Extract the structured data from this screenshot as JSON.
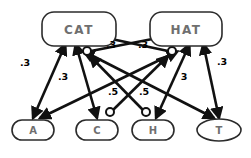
{
  "diagram": {
    "background_color": "#ffffff",
    "edge_color": "#111111",
    "node_border_color": "#2b2b2b",
    "node_fill_color": "#ffffff",
    "node_text_color": "#6f6f6f",
    "word_nodes": [
      {
        "id": "cat",
        "label": "CAT",
        "shape": "rounded-rect",
        "cx": 79,
        "cy": 29,
        "w": 74,
        "h": 34
      },
      {
        "id": "hat",
        "label": "HAT",
        "shape": "rounded-rect",
        "cx": 186,
        "cy": 29,
        "w": 72,
        "h": 34
      }
    ],
    "letter_nodes": [
      {
        "id": "a",
        "label": "A",
        "shape": "rounded-rect",
        "cx": 33,
        "cy": 130,
        "w": 42,
        "h": 20
      },
      {
        "id": "c",
        "label": "C",
        "shape": "rounded-rect",
        "cx": 97,
        "cy": 130,
        "w": 42,
        "h": 20
      },
      {
        "id": "h",
        "label": "H",
        "shape": "rounded-rect",
        "cx": 153,
        "cy": 130,
        "w": 42,
        "h": 20
      },
      {
        "id": "t",
        "label": "T",
        "shape": "ellipse",
        "cx": 219,
        "cy": 130,
        "w": 44,
        "h": 22
      }
    ],
    "edges": [
      {
        "id": "cat-a",
        "from": "cat",
        "to": "a",
        "type": "excitatory-bidirectional",
        "weight": ".3"
      },
      {
        "id": "cat-c",
        "from": "cat",
        "to": "c",
        "type": "excitatory-bidirectional",
        "weight": ".3"
      },
      {
        "id": "cat-t",
        "from": "cat",
        "to": "t",
        "type": "excitatory-bidirectional",
        "weight": ".5"
      },
      {
        "id": "hat-h",
        "from": "hat",
        "to": "h",
        "type": "excitatory-bidirectional",
        "weight": "3"
      },
      {
        "id": "hat-t",
        "from": "hat",
        "to": "t",
        "type": "excitatory-bidirectional",
        "weight": ".3"
      },
      {
        "id": "hat-a",
        "from": "hat",
        "to": "a",
        "type": "excitatory-bidirectional",
        "weight": ".5"
      },
      {
        "id": "cat-inhibits-hat-side",
        "from": "cat",
        "to": "hat",
        "type": "inhibitory",
        "weight": ".3"
      },
      {
        "id": "hat-inhibits-cat-side",
        "from": "hat",
        "to": "cat",
        "type": "inhibitory",
        "weight": ".3"
      }
    ],
    "weight_labels": [
      {
        "id": "w-left-outer",
        "text": ".3",
        "x": 25,
        "y": 63
      },
      {
        "id": "w-left-inner",
        "text": ".3",
        "x": 63,
        "y": 77
      },
      {
        "id": "w-top-left",
        "text": ".3",
        "x": 111,
        "y": 45
      },
      {
        "id": "w-top-right",
        "text": ".3",
        "x": 143,
        "y": 45
      },
      {
        "id": "w-mid-left",
        "text": ".5",
        "x": 113,
        "y": 92
      },
      {
        "id": "w-mid-right",
        "text": ".5",
        "x": 144,
        "y": 92
      },
      {
        "id": "w-right-inner",
        "text": "3",
        "x": 184,
        "y": 77
      },
      {
        "id": "w-right-outer",
        "text": ".3",
        "x": 222,
        "y": 62
      }
    ],
    "inhibition_dots": [
      {
        "id": "dot-cat",
        "cx": 87,
        "cy": 51,
        "r": 4
      },
      {
        "id": "dot-hat",
        "cx": 172,
        "cy": 51,
        "r": 4
      },
      {
        "id": "dot-c",
        "cx": 110,
        "cy": 112,
        "r": 4
      },
      {
        "id": "dot-h",
        "cx": 146,
        "cy": 112,
        "r": 4
      }
    ]
  }
}
